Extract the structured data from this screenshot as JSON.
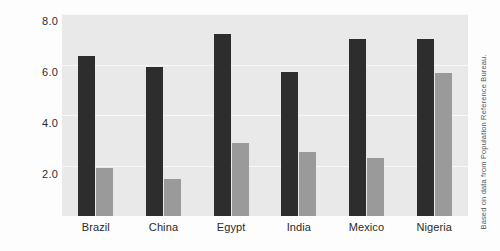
{
  "chart_data": {
    "type": "bar",
    "title": "",
    "subtitle": "",
    "xlabel": "",
    "ylabel": "Total fertility rate",
    "categories": [
      "Brazil",
      "China",
      "Egypt",
      "India",
      "Mexico",
      "Nigeria"
    ],
    "series": [
      {
        "name": "dark-series",
        "values": [
          6.35,
          5.9,
          7.2,
          5.7,
          7.0,
          7.0
        ]
      },
      {
        "name": "light-series",
        "values": [
          1.9,
          1.45,
          2.9,
          2.55,
          2.3,
          5.65
        ]
      }
    ],
    "ylim": [
      0,
      8
    ],
    "yticks": [
      "2.0",
      "4.0",
      "6.0",
      "8.0"
    ],
    "ytick_values": [
      2.0,
      4.0,
      6.0,
      8.0
    ],
    "grid": true,
    "legend": "none",
    "annotation": "Based on data from Population Reference Bureau.",
    "colors": {
      "dark_bar": "#2d2d2d",
      "light_bar": "#9a9a9a",
      "plot_background": "#e9e9e9",
      "gridline": "#f7f7f7",
      "figure_background": "#fdfdfd",
      "text": "#2b2b2b"
    }
  }
}
